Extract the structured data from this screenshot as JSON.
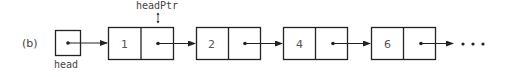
{
  "figure_label": "(b)",
  "head": {
    "label": "head"
  },
  "head_ptr": {
    "label": "headPtr",
    "points_to_node_index": 0
  },
  "nodes": [
    {
      "value": "1"
    },
    {
      "value": "2"
    },
    {
      "value": "4"
    },
    {
      "value": "6"
    }
  ],
  "continuation": "• • •",
  "colors": {
    "stroke": "#222222",
    "text": "#444444",
    "background": "#ffffff"
  }
}
